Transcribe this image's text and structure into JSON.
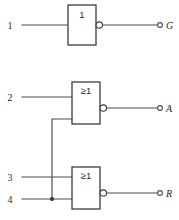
{
  "diagram": {
    "background_color": "#ffffff",
    "line_color": "#4a4a4a",
    "gate_outline_color": "#3c3c3c",
    "text_color": "#2b2b2b",
    "gates": [
      {
        "id": "gate-buffer-1",
        "symbol": "1",
        "type": "inverter",
        "description": "IEC rectangular symbol labelled 1 with inverting output bubble",
        "x": 68,
        "y": 5,
        "width": 28,
        "height": 40
      },
      {
        "id": "gate-or-2",
        "symbol": "≥1",
        "type": "nor",
        "description": "IEC rectangular OR symbol labelled greater-than-or-equal 1 with inverting output bubble",
        "x": 72,
        "y": 82,
        "width": 28,
        "height": 42
      },
      {
        "id": "gate-or-3",
        "symbol": "≥1",
        "type": "nor",
        "description": "IEC rectangular OR symbol labelled greater-than-or-equal 1 with inverting output bubble",
        "x": 72,
        "y": 167,
        "width": 28,
        "height": 42
      }
    ],
    "inputs": [
      {
        "id": "input-1",
        "label": "1",
        "x": 10,
        "y": 25
      },
      {
        "id": "input-2",
        "label": "2",
        "x": 10,
        "y": 97
      },
      {
        "id": "input-3",
        "label": "3",
        "x": 10,
        "y": 177
      },
      {
        "id": "input-4",
        "label": "4",
        "x": 10,
        "y": 199
      }
    ],
    "outputs": [
      {
        "id": "output-g",
        "label": "G",
        "terminal_x": 160,
        "terminal_y": 25,
        "label_x": 166
      },
      {
        "id": "output-a",
        "label": "A",
        "terminal_x": 160,
        "terminal_y": 108,
        "label_x": 166
      },
      {
        "id": "output-r",
        "label": "R",
        "terminal_x": 160,
        "terminal_y": 193,
        "label_x": 166
      }
    ],
    "junctions": [
      {
        "id": "junction-feedback-input4",
        "x": 52,
        "y": 199,
        "radius": 2.1
      }
    ],
    "crossings": [
      {
        "id": "crossing-feedback-input3",
        "x": 52,
        "y": 177
      }
    ],
    "nets": [
      {
        "id": "net-in1-to-buffer",
        "from": "input-1",
        "to": "gate-buffer-1"
      },
      {
        "id": "net-buffer-to-g",
        "from": "gate-buffer-1",
        "to": "output-g"
      },
      {
        "id": "net-in2-to-or2",
        "from": "input-2",
        "to": "gate-or-2"
      },
      {
        "id": "net-or2-to-a",
        "from": "gate-or-2",
        "to": "output-a"
      },
      {
        "id": "net-in3-to-or3",
        "from": "input-3",
        "to": "gate-or-3"
      },
      {
        "id": "net-in4-to-or3",
        "from": "input-4",
        "to": "gate-or-3"
      },
      {
        "id": "net-or3-to-r",
        "from": "gate-or-3",
        "to": "output-r"
      },
      {
        "id": "net-feedback-or2-lower-input",
        "from": "input-4",
        "to": "gate-or-2",
        "description": "cross-coupled feedback riser from lower input rail up to second gate lower input"
      }
    ]
  }
}
